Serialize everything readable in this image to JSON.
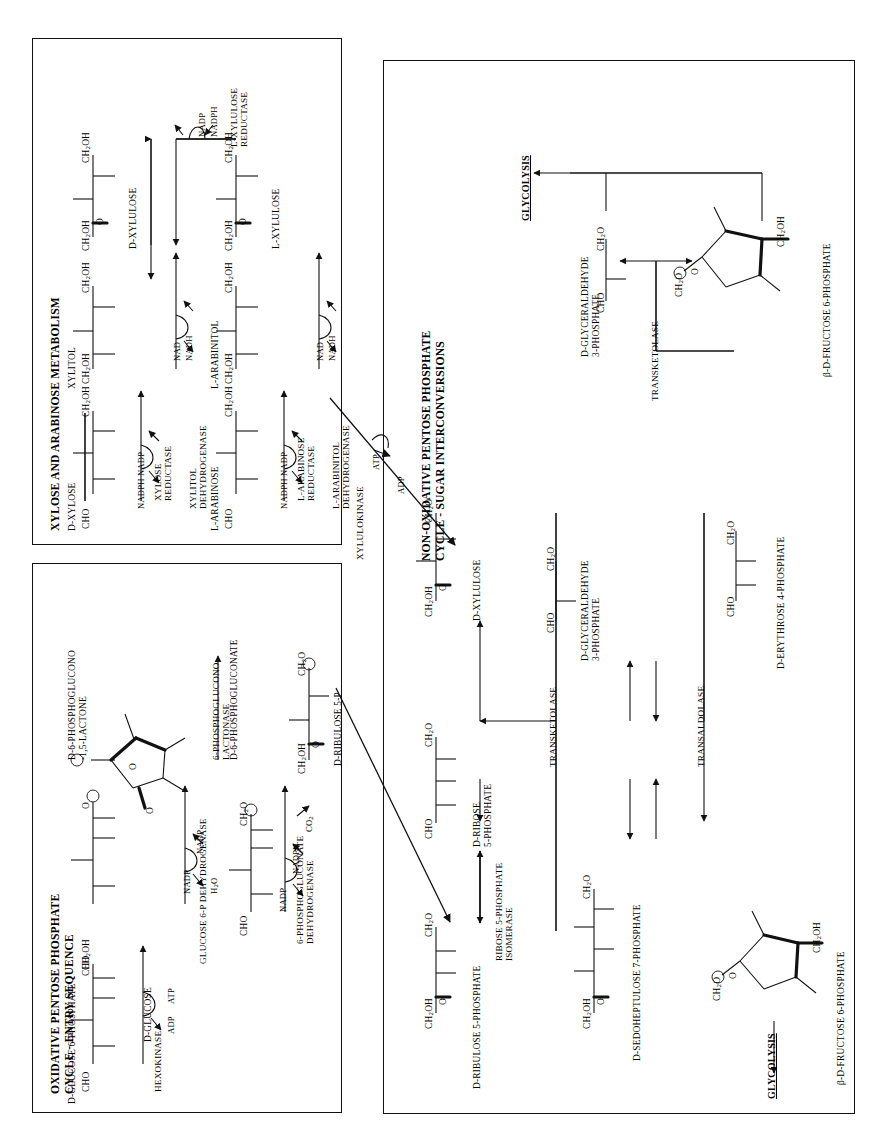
{
  "page": {
    "orientation": "text rotated 90 degrees counter-clockwise (landscape figure on portrait page)",
    "background": "#ffffff",
    "ink": "#111111"
  },
  "panels": [
    {
      "id": "xylose-arabinose",
      "title": "XYLOSE AND ARABINOSE METABOLISM",
      "metabolites": [
        "D-XYLOSE",
        "XYLITOL",
        "D-XYLULOSE",
        "L-ARABINOSE",
        "L-ARABINITOL",
        "L-XYLULOSE"
      ],
      "enzymes": [
        "XYLOSE\nREDUCTASE",
        "XYLITOL\nDEHYDROGENASE",
        "L-ARABINOSE\nREDUCTASE",
        "L-ARABINITOL\nDEHYDROGENASE",
        "L-XYLULOSE\nREDUCTASE"
      ],
      "cofactors": [
        "NADPH",
        "NADP",
        "NAD",
        "NADH",
        "NADP",
        "NADPH",
        "NAD",
        "NADH"
      ],
      "formula_labels": [
        "CHO",
        "CH2OH",
        "O"
      ]
    },
    {
      "id": "oxidative-ppp",
      "title": "OXIDATIVE PENTOSE PHOSPHATE\nCYCLE - ENTRY SEQUENCE",
      "title_line1": "OXIDATIVE PENTOSE PHOSPHATE",
      "title_line2": "CYCLE - ENTRY SEQUENCE",
      "metabolites": [
        "D-GLUCOSE",
        "D-GLUCOSE 6-PHOSPHATE",
        "D-6-PHOSPHOGLUCONO\n-1,5-LACTONE",
        "D-6-PHOSPHOGLUCONATE",
        "D-RIBULOSE 5-P"
      ],
      "enzymes": [
        "HEXOKINASE",
        "GLUCOSE 6-P DEHYDROGENASE",
        "6-PHOSPHOGLUCONO\nLACTONASE",
        "6-PHOSPHOGLUCONATE\nDEHYDROGENASE"
      ],
      "cofactors": [
        "ADP",
        "ATP",
        "NADP",
        "NADP",
        "H2O",
        "NADP",
        "NADPH",
        "CO2"
      ]
    },
    {
      "id": "nonoxidative-ppp",
      "title": "NON-OXIDATIVE PENTOSE PHOSPHATE\nCYCLE - SUGAR INTERCONVERSIONS",
      "title_line1": "NON-OXIDATIVE PENTOSE PHOSPHATE",
      "title_line2": "CYCLE - SUGAR INTERCONVERSIONS",
      "metabolites": [
        "D-XYLULOSE",
        "D-RIBULOSE 5-PHOSPHATE",
        "D-RIBOSE\n5-PHOSPHATE",
        "D-SEDOHEPTULOSE 7-PHOSPHATE",
        "D-GLYCERALDEHYDE\n3-PHOSPHATE",
        "D-ERYTHROSE 4-PHOSPHATE",
        "β-D-FRUCTOSE 6-PHOSPHATE"
      ],
      "enzymes": [
        "TRANSKETOLASE",
        "TRANSKETOLASE",
        "TRANSALDOLASE",
        "RIBOSE 5-PHOSPHATE\nISOMERASE"
      ],
      "exits": [
        "GLYCOLYSIS",
        "GLYCOLYSIS"
      ]
    }
  ],
  "connectors": [
    {
      "label": "XYLULOKINASE",
      "cofactors": [
        "ATP",
        "ADP"
      ],
      "from": "D-XYLULOSE (xylose panel)",
      "to": "D-XYLULOSE (non-oxidative panel)"
    },
    {
      "label": "",
      "cofactors": [],
      "from": "D-RIBULOSE 5-P (oxidative panel)",
      "to": "D-RIBULOSE 5-PHOSPHATE (non-oxidative panel)"
    }
  ],
  "labels": {
    "cho": "CHO",
    "ch2oh": "CH",
    "ch2oh_sub": "2",
    "ch2oh_tail": "OH",
    "ch2o": "CH",
    "ch2o_sub": "2",
    "ch2o_tail": "O",
    "o": "O",
    "h2o": "H",
    "h2o_sub": "2",
    "h2o_tail": "O",
    "co2": "CO",
    "co2_sub": "2",
    "nad": "NAD",
    "nadh": "NADH",
    "nadp": "NADP",
    "nadph": "NADPH",
    "atp": "ATP",
    "adp": "ADP",
    "phosphate_symbol": "P",
    "glycolysis": "GLYCOLYSIS",
    "beta": "β"
  }
}
